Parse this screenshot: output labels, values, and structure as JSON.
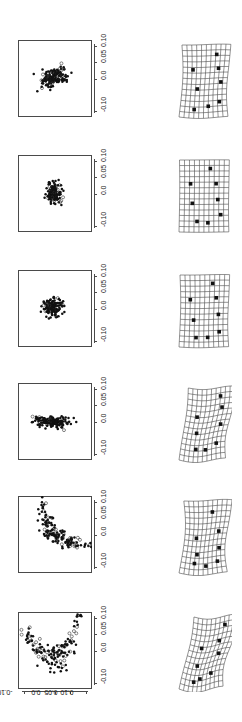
{
  "figure": {
    "title": "",
    "rows": 6,
    "columns": 2,
    "left_column_name": "shape-scatter-plot",
    "right_column_name": "deformation-grid"
  },
  "axis": {
    "orientation": "rotated",
    "tick_labels": [
      "-0.10",
      "0.0",
      "0.05",
      "0.10"
    ],
    "tick_values": [
      -0.1,
      0.0,
      0.05,
      0.1
    ],
    "vertical_label_text": "0.0 0.05 0.10",
    "vertical_low_label": "-0.10",
    "horizontal_label_text": "0.0 0.05 0.10",
    "horizontal_low_label": "-0.10",
    "limits": [
      -0.12,
      0.12
    ],
    "axis_color": "#4a4a4a"
  },
  "chart_data": {
    "type": "scatter",
    "title": "",
    "xlabel": "",
    "ylabel": "",
    "xlim": [
      -0.12,
      0.12
    ],
    "ylim": [
      -0.12,
      0.12
    ],
    "grid": false,
    "legend": "none",
    "point_styles": {
      "filled": "solid black circle",
      "open": "open circle"
    },
    "panels": [
      {
        "index": 1,
        "name": "scatter-panel-1",
        "description": "compact cluster, slight positive diagonal elongation, centered near origin",
        "n_points": 150,
        "center": [
          -0.005,
          0.002
        ],
        "spread": [
          0.022,
          0.014
        ],
        "angle_deg": 28,
        "open_fraction": 0.12
      },
      {
        "index": 2,
        "name": "scatter-panel-2",
        "description": "tight round cluster centered near origin",
        "n_points": 150,
        "center": [
          -0.004,
          0.0
        ],
        "spread": [
          0.013,
          0.014
        ],
        "angle_deg": 0,
        "open_fraction": 0.08
      },
      {
        "index": 3,
        "name": "scatter-panel-3",
        "description": "compact cluster with a few stragglers below",
        "n_points": 150,
        "center": [
          -0.006,
          0.004
        ],
        "spread": [
          0.016,
          0.015
        ],
        "angle_deg": 15,
        "open_fraction": 0.1
      },
      {
        "index": 4,
        "name": "scatter-panel-4",
        "description": "strongly vertically elongated cluster",
        "n_points": 150,
        "center": [
          -0.006,
          0.0
        ],
        "spread": [
          0.009,
          0.03
        ],
        "angle_deg": 85,
        "open_fraction": 0.07
      },
      {
        "index": 5,
        "name": "scatter-panel-5",
        "description": "long negative-diagonal band from upper-left to lower-right",
        "n_points": 165,
        "center": [
          0.0,
          0.0
        ],
        "spread": [
          0.052,
          0.013
        ],
        "angle_deg": -42,
        "open_fraction": 0.22
      },
      {
        "index": 6,
        "name": "scatter-panel-6",
        "description": "wide crescent/curved band, dense on the right, open circles on the left",
        "n_points": 180,
        "center": [
          0.0,
          -0.01
        ],
        "spread": [
          0.075,
          0.02
        ],
        "angle_deg": 10,
        "open_fraction": 0.3
      }
    ]
  },
  "grids": [
    {
      "index": 1,
      "name": "deformation-grid-1",
      "description": "mildly warped grid, left edge bowed",
      "shear_x": 0.06,
      "bow": 0.1,
      "twist": 0.05,
      "n_landmarks": 8,
      "landmarks": [
        [
          0.72,
          0.14
        ],
        [
          0.78,
          0.33
        ],
        [
          0.22,
          0.34
        ],
        [
          0.86,
          0.52
        ],
        [
          0.34,
          0.6
        ],
        [
          0.84,
          0.79
        ],
        [
          0.6,
          0.84
        ],
        [
          0.3,
          0.88
        ]
      ]
    },
    {
      "index": 2,
      "name": "deformation-grid-2",
      "description": "near-regular rectangular grid, minimal deformation",
      "shear_x": 0.01,
      "bow": 0.02,
      "twist": 0.01,
      "n_landmarks": 8,
      "landmarks": [
        [
          0.62,
          0.12
        ],
        [
          0.74,
          0.33
        ],
        [
          0.22,
          0.33
        ],
        [
          0.78,
          0.55
        ],
        [
          0.26,
          0.6
        ],
        [
          0.84,
          0.76
        ],
        [
          0.58,
          0.87
        ],
        [
          0.36,
          0.85
        ]
      ]
    },
    {
      "index": 3,
      "name": "deformation-grid-3",
      "description": "slightly warped grid, gentle vertical wave",
      "shear_x": 0.02,
      "bow": 0.05,
      "twist": 0.03,
      "n_landmarks": 8,
      "landmarks": [
        [
          0.66,
          0.12
        ],
        [
          0.74,
          0.32
        ],
        [
          0.2,
          0.34
        ],
        [
          0.8,
          0.55
        ],
        [
          0.28,
          0.62
        ],
        [
          0.82,
          0.79
        ],
        [
          0.58,
          0.86
        ],
        [
          0.34,
          0.86
        ]
      ]
    },
    {
      "index": 4,
      "name": "deformation-grid-4",
      "description": "sheared grid, top edge displaced right, left edge leaning",
      "shear_x": 0.2,
      "bow": 0.06,
      "twist": 0.16,
      "n_landmarks": 8,
      "landmarks": [
        [
          0.7,
          0.12
        ],
        [
          0.76,
          0.28
        ],
        [
          0.24,
          0.38
        ],
        [
          0.82,
          0.52
        ],
        [
          0.3,
          0.6
        ],
        [
          0.8,
          0.78
        ],
        [
          0.56,
          0.84
        ],
        [
          0.34,
          0.82
        ]
      ]
    },
    {
      "index": 5,
      "name": "deformation-grid-5",
      "description": "curved grid with compressed left margin and bowed rows",
      "shear_x": 0.1,
      "bow": 0.16,
      "twist": 0.1,
      "n_landmarks": 8,
      "landmarks": [
        [
          0.6,
          0.16
        ],
        [
          0.8,
          0.43
        ],
        [
          0.28,
          0.5
        ],
        [
          0.86,
          0.66
        ],
        [
          0.34,
          0.72
        ],
        [
          0.82,
          0.84
        ],
        [
          0.56,
          0.88
        ],
        [
          0.3,
          0.84
        ]
      ]
    },
    {
      "index": 6,
      "name": "deformation-grid-6",
      "description": "strongly sheared and rotated narrow grid leaning right",
      "shear_x": 0.34,
      "bow": 0.08,
      "twist": 0.22,
      "n_landmarks": 8,
      "landmarks": [
        [
          0.72,
          0.12
        ],
        [
          0.66,
          0.33
        ],
        [
          0.28,
          0.4
        ],
        [
          0.76,
          0.52
        ],
        [
          0.3,
          0.64
        ],
        [
          0.7,
          0.78
        ],
        [
          0.44,
          0.82
        ],
        [
          0.3,
          0.86
        ]
      ]
    }
  ]
}
